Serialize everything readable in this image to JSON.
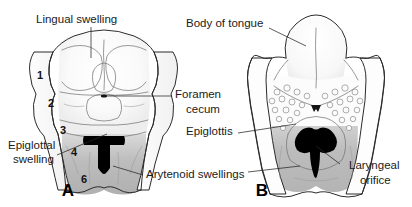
{
  "figure": {
    "background_color": "#ffffff",
    "ink_color": "#1b1b1b",
    "shade_mid": "#b8b8b8",
    "shade_light": "#e6e6e6",
    "orifice_color": "#000000"
  },
  "panels": [
    {
      "id": "A",
      "letter": "A",
      "caption": "A",
      "labels": [
        {
          "key": "lingual_swelling",
          "text": "Lingual swelling"
        },
        {
          "key": "epiglottal_swelling_line1",
          "text": "Epiglottal"
        },
        {
          "key": "epiglottal_swelling_line2",
          "text": "swelling"
        }
      ],
      "arch_numbers": [
        "1",
        "2",
        "3",
        "4",
        "6"
      ]
    },
    {
      "id": "B",
      "letter": "B",
      "caption": "B",
      "labels": [
        {
          "key": "body_of_tongue",
          "text": "Body of tongue"
        },
        {
          "key": "epiglottis",
          "text": "Epiglottis"
        },
        {
          "key": "laryngeal_orifice_line1",
          "text": "Laryngeal"
        },
        {
          "key": "laryngeal_orifice_line2",
          "text": "orifice"
        }
      ]
    }
  ],
  "shared_labels": [
    {
      "key": "foramen_cecum_line1",
      "text": "Foramen"
    },
    {
      "key": "foramen_cecum_line2",
      "text": "cecum"
    },
    {
      "key": "arytenoid_swellings",
      "text": "Arytenoid swellings"
    }
  ],
  "text": {
    "lingual_swelling": "Lingual swelling",
    "epiglottal_line1": "Epiglottal",
    "epiglottal_line2": "swelling",
    "foramen_line1": "Foramen",
    "foramen_line2": "cecum",
    "arytenoid_swellings": "Arytenoid swellings",
    "body_of_tongue": "Body of tongue",
    "epiglottis": "Epiglottis",
    "laryngeal_line1": "Laryngeal",
    "laryngeal_line2": "orifice",
    "panel_a": "A",
    "panel_b": "B",
    "num1": "1",
    "num2": "2",
    "num3": "3",
    "num4": "4",
    "num6": "6"
  }
}
